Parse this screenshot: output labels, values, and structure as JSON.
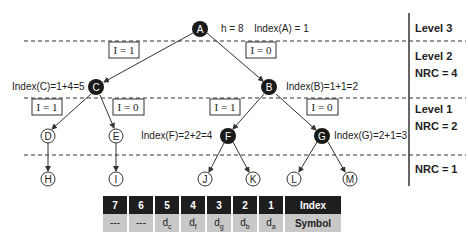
{
  "tree": {
    "root_info": {
      "h_label": "h = 8",
      "index_label": "Index(A) = 1"
    },
    "nodes": {
      "A": {
        "label": "A",
        "filled": true
      },
      "B": {
        "label": "B",
        "filled": true
      },
      "C": {
        "label": "C",
        "filled": true
      },
      "D": {
        "label": "D",
        "filled": false
      },
      "E": {
        "label": "E",
        "filled": false
      },
      "F": {
        "label": "F",
        "filled": true
      },
      "G": {
        "label": "G",
        "filled": true
      },
      "H": {
        "label": "H",
        "filled": false
      },
      "I": {
        "label": "I",
        "filled": false
      },
      "J": {
        "label": "J",
        "filled": false
      },
      "K": {
        "label": "K",
        "filled": false
      },
      "L": {
        "label": "L",
        "filled": false
      },
      "M": {
        "label": "M",
        "filled": false
      }
    },
    "index_labels": {
      "C": "Index(C)=1+4=5",
      "B": "Index(B)=1+1=2",
      "F": "Index(F)=2+2=4",
      "G": "Index(G)=2+1=3"
    },
    "edge_labels": {
      "A_C": "I = 1",
      "A_B": "I = 0",
      "C_D": "I = 1",
      "C_E": "I = 0",
      "B_F": "I = 1",
      "B_G": "I = 0"
    }
  },
  "levels": {
    "level3": {
      "title": "Level 3"
    },
    "level2": {
      "title": "Level 2",
      "nrc": "NRC = 4"
    },
    "level1": {
      "title": "Level 1",
      "nrc": "NRC = 2"
    },
    "level0": {
      "nrc": "NRC = 1"
    }
  },
  "table": {
    "index_row": {
      "header": "Index",
      "cells": [
        "7",
        "6",
        "5",
        "4",
        "3",
        "2",
        "1"
      ]
    },
    "symbol_row": {
      "header": "Symbol",
      "cells": [
        {
          "base": "---",
          "sub": ""
        },
        {
          "base": "---",
          "sub": ""
        },
        {
          "base": "d",
          "sub": "c"
        },
        {
          "base": "d",
          "sub": "f"
        },
        {
          "base": "d",
          "sub": "g"
        },
        {
          "base": "d",
          "sub": "b"
        },
        {
          "base": "d",
          "sub": "a"
        }
      ]
    }
  },
  "colors": {
    "filled_node": "#1a1a1a",
    "table_index_bg": "#1e1e1e",
    "table_symbol_bg": "#c8c8c8",
    "line": "#333333"
  }
}
